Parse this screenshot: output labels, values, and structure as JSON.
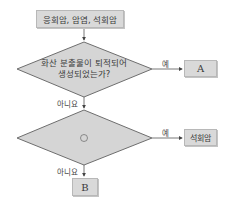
{
  "flowchart": {
    "start_box": "응회암, 암염, 석회암",
    "decision1": {
      "line1": "화산 분출물이 퇴적되어",
      "line2": "생성되었는가?",
      "yes_label": "예",
      "no_label": "아니요",
      "yes_result": "A"
    },
    "decision2": {
      "text": "㉠",
      "yes_label": "예",
      "no_label": "아니요",
      "yes_result": "석회암",
      "no_result": "B"
    }
  },
  "colors": {
    "fill": "#d9d9d9",
    "stroke": "#6e6e6e"
  }
}
